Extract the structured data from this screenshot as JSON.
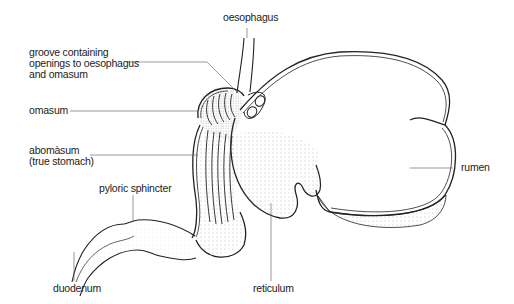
{
  "labels": {
    "oesophagus": "oesophagus",
    "groove_line1": "groove containing",
    "groove_line2": "openings to oesophagus",
    "groove_line3": "and omasum",
    "omasum": "omasum",
    "abomasum_line1": "abomàsum",
    "abomasum_line2": "(true stomach)",
    "pyloric": "pyloric sphincter",
    "duodenum": "duodenum",
    "reticulum": "reticulum",
    "rumen": "rumen"
  },
  "colors": {
    "line": "#222222",
    "leader": "#555555",
    "stipple": "#888888",
    "background": "#ffffff"
  }
}
